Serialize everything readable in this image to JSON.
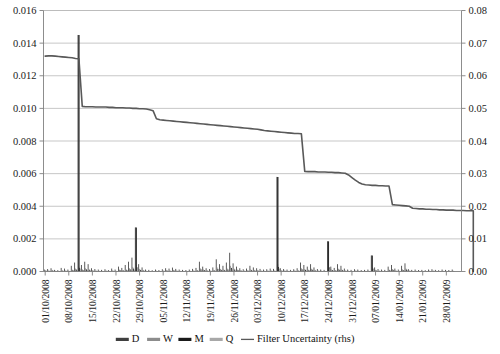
{
  "chart_data": {
    "type": "bar",
    "title": "",
    "subtitle": "",
    "xlabel": "",
    "ylabel": "",
    "y2label": "",
    "grid": true,
    "legend_position": "bottom",
    "ylim": [
      0,
      0.016
    ],
    "y2lim": [
      0,
      0.08
    ],
    "yticks": [
      "0.000",
      "0.002",
      "0.004",
      "0.006",
      "0.008",
      "0.010",
      "0.012",
      "0.014",
      "0.016"
    ],
    "ytick_values": [
      0,
      0.002,
      0.004,
      0.006,
      0.008,
      0.01,
      0.012,
      0.014,
      0.016
    ],
    "y2ticks": [
      "0.00",
      "0.01",
      "0.02",
      "0.03",
      "0.04",
      "0.05",
      "0.06",
      "0.07",
      "0.08"
    ],
    "y2tick_values": [
      0,
      0.01,
      0.02,
      0.03,
      0.04,
      0.05,
      0.06,
      0.07,
      0.08
    ],
    "xticks": [
      "01/10/2008",
      "08/10/2008",
      "15/10/2008",
      "22/10/2008",
      "29/10/2008",
      "05/11/2008",
      "12/11/2008",
      "19/11/2008",
      "26/11/2008",
      "03/12/2008",
      "10/12/2008",
      "17/12/2008",
      "24/12/2008",
      "31/12/2008",
      "07/01/2009",
      "14/01/2009",
      "21/01/2009",
      "28/01/2009"
    ],
    "xtick_indices": [
      0,
      7,
      14,
      21,
      28,
      35,
      42,
      49,
      56,
      63,
      70,
      77,
      84,
      91,
      98,
      105,
      112,
      119
    ],
    "n_points": 124,
    "legend": [
      {
        "label": "D",
        "color": "#3f3f3f",
        "type": "bar"
      },
      {
        "label": "W",
        "color": "#8c8c8c",
        "type": "bar"
      },
      {
        "label": "M",
        "color": "#1a1a1a",
        "type": "bar"
      },
      {
        "label": "Q",
        "color": "#a8a8a8",
        "type": "bar"
      },
      {
        "label": "Filter Uncertainty (rhs)",
        "color": "#595959",
        "type": "line"
      }
    ],
    "series": [
      {
        "name": "D",
        "axis": "left",
        "type": "bar",
        "color": "#3f3f3f",
        "values": [
          0.00012,
          0.00015,
          0.0002,
          0.0001,
          8e-05,
          0.00022,
          0.00018,
          0.00012,
          0.00035,
          0.00055,
          0.0145,
          0.0004,
          0.0006,
          0.00045,
          0.0002,
          0.00015,
          0.00012,
          0.0001,
          0.00014,
          9e-05,
          0.00018,
          0.00012,
          0.0003,
          0.00022,
          0.0004,
          0.0006,
          0.00085,
          0.0027,
          0.00045,
          0.00025,
          0.00012,
          0.0001,
          8e-05,
          0.00012,
          9e-05,
          0.00014,
          0.0002,
          0.00018,
          0.00024,
          0.00016,
          0.00012,
          0.0001,
          9e-05,
          0.00012,
          0.00016,
          0.00022,
          0.0006,
          0.0003,
          0.0002,
          0.00015,
          0.00025,
          0.00075,
          0.00045,
          0.00035,
          0.00055,
          0.00115,
          0.0005,
          0.0003,
          0.0002,
          0.00014,
          0.00018,
          0.00035,
          0.00025,
          0.0002,
          0.00016,
          0.00012,
          0.00014,
          0.00018,
          0.00016,
          0.0058,
          0.0002,
          0.00015,
          0.00012,
          0.0001,
          0.00014,
          0.0002,
          0.00055,
          0.0004,
          0.0003,
          0.00045,
          0.00025,
          0.00015,
          0.00012,
          0.0001,
          0.00185,
          0.0003,
          0.00022,
          0.00045,
          0.00035,
          0.00018,
          0.00012,
          0.0001,
          0.00014,
          0.00012,
          9e-05,
          0.0001,
          0.00012,
          0.00098,
          0.00025,
          0.00015,
          0.00012,
          0.0001,
          0.0003,
          0.0004,
          0.00018,
          0.00012,
          0.00035,
          0.0005,
          0.00014,
          0.0001,
          0.00012,
          9e-05,
          0.0001,
          8e-05,
          0.00012,
          0.00014,
          0.0001,
          8e-05,
          0.00012,
          0.0001,
          9e-05,
          0.00012
        ]
      },
      {
        "name": "W",
        "axis": "left",
        "type": "bar",
        "color": "#8c8c8c",
        "values": [
          8e-05,
          6e-05,
          0.0001,
          5e-05,
          4e-05,
          8e-05,
          6e-05,
          5e-05,
          0.00012,
          0.00018,
          0.0003,
          0.00014,
          0.0002,
          0.00016,
          8e-05,
          6e-05,
          5e-05,
          4e-05,
          6e-05,
          4e-05,
          7e-05,
          5e-05,
          0.00012,
          9e-05,
          0.00014,
          0.0002,
          0.00028,
          0.0004,
          0.00016,
          0.0001,
          5e-05,
          4e-05,
          3e-05,
          5e-05,
          4e-05,
          6e-05,
          8e-05,
          7e-05,
          0.0001,
          6e-05,
          5e-05,
          4e-05,
          4e-05,
          5e-05,
          6e-05,
          9e-05,
          0.0002,
          0.00012,
          8e-05,
          6e-05,
          0.0001,
          0.00025,
          0.00016,
          0.00013,
          0.00018,
          0.00035,
          0.00018,
          0.00012,
          8e-05,
          6e-05,
          7e-05,
          0.00013,
          0.0001,
          8e-05,
          6e-05,
          5e-05,
          6e-05,
          7e-05,
          6e-05,
          0.00045,
          8e-05,
          6e-05,
          5e-05,
          4e-05,
          6e-05,
          8e-05,
          0.0002,
          0.00015,
          0.00012,
          0.00017,
          0.0001,
          6e-05,
          5e-05,
          4e-05,
          0.0004,
          0.00012,
          9e-05,
          0.00017,
          0.00013,
          7e-05,
          5e-05,
          4e-05,
          6e-05,
          5e-05,
          4e-05,
          4e-05,
          5e-05,
          0.00028,
          0.0001,
          6e-05,
          5e-05,
          4e-05,
          0.00012,
          0.00015,
          7e-05,
          5e-05,
          0.00013,
          0.00019,
          6e-05,
          4e-05,
          5e-05,
          4e-05,
          4e-05,
          3e-05,
          5e-05,
          6e-05,
          4e-05,
          3e-05,
          5e-05,
          4e-05,
          4e-05,
          5e-05
        ]
      },
      {
        "name": "M",
        "axis": "left",
        "type": "bar",
        "color": "#1a1a1a",
        "values": [
          5e-05,
          4e-05,
          6e-05,
          3e-05,
          3e-05,
          5e-05,
          4e-05,
          3e-05,
          8e-05,
          0.00012,
          0.00022,
          9e-05,
          0.00013,
          0.0001,
          5e-05,
          4e-05,
          3e-05,
          3e-05,
          4e-05,
          3e-05,
          4e-05,
          3e-05,
          8e-05,
          6e-05,
          9e-05,
          0.00013,
          0.00018,
          0.00026,
          0.0001,
          6e-05,
          3e-05,
          3e-05,
          2e-05,
          3e-05,
          3e-05,
          4e-05,
          5e-05,
          4e-05,
          6e-05,
          4e-05,
          3e-05,
          3e-05,
          2e-05,
          3e-05,
          4e-05,
          6e-05,
          0.00013,
          8e-05,
          5e-05,
          4e-05,
          6e-05,
          0.00016,
          0.0001,
          8e-05,
          0.00012,
          0.00022,
          0.00012,
          8e-05,
          5e-05,
          4e-05,
          5e-05,
          8e-05,
          6e-05,
          5e-05,
          4e-05,
          3e-05,
          4e-05,
          4e-05,
          4e-05,
          0.00028,
          5e-05,
          4e-05,
          3e-05,
          3e-05,
          4e-05,
          5e-05,
          0.00013,
          0.0001,
          8e-05,
          0.00011,
          6e-05,
          4e-05,
          3e-05,
          3e-05,
          0.00026,
          8e-05,
          6e-05,
          0.00011,
          8e-05,
          4e-05,
          3e-05,
          3e-05,
          4e-05,
          3e-05,
          2e-05,
          3e-05,
          3e-05,
          0.00018,
          6e-05,
          4e-05,
          3e-05,
          3e-05,
          8e-05,
          0.0001,
          4e-05,
          3e-05,
          8e-05,
          0.00012,
          4e-05,
          3e-05,
          3e-05,
          2e-05,
          3e-05,
          2e-05,
          3e-05,
          4e-05,
          3e-05,
          2e-05,
          3e-05,
          3e-05,
          2e-05,
          3e-05
        ]
      },
      {
        "name": "Q",
        "axis": "left",
        "type": "bar",
        "color": "#a8a8a8",
        "values": [
          3e-05,
          2e-05,
          4e-05,
          2e-05,
          2e-05,
          3e-05,
          2e-05,
          2e-05,
          5e-05,
          7e-05,
          0.00014,
          5e-05,
          8e-05,
          6e-05,
          3e-05,
          2e-05,
          2e-05,
          2e-05,
          2e-05,
          2e-05,
          3e-05,
          2e-05,
          5e-05,
          4e-05,
          6e-05,
          8e-05,
          0.00011,
          0.00016,
          6e-05,
          4e-05,
          2e-05,
          2e-05,
          1e-05,
          2e-05,
          2e-05,
          2e-05,
          3e-05,
          3e-05,
          4e-05,
          2e-05,
          2e-05,
          2e-05,
          1e-05,
          2e-05,
          2e-05,
          4e-05,
          8e-05,
          5e-05,
          3e-05,
          2e-05,
          4e-05,
          0.0001,
          6e-05,
          5e-05,
          7e-05,
          0.00013,
          7e-05,
          5e-05,
          3e-05,
          2e-05,
          3e-05,
          5e-05,
          4e-05,
          3e-05,
          2e-05,
          2e-05,
          2e-05,
          3e-05,
          2e-05,
          0.00017,
          3e-05,
          2e-05,
          2e-05,
          2e-05,
          2e-05,
          3e-05,
          8e-05,
          6e-05,
          5e-05,
          7e-05,
          4e-05,
          2e-05,
          2e-05,
          2e-05,
          0.00016,
          5e-05,
          4e-05,
          7e-05,
          5e-05,
          3e-05,
          2e-05,
          2e-05,
          2e-05,
          2e-05,
          1e-05,
          2e-05,
          2e-05,
          0.00011,
          4e-05,
          2e-05,
          2e-05,
          2e-05,
          5e-05,
          6e-05,
          3e-05,
          2e-05,
          5e-05,
          8e-05,
          2e-05,
          2e-05,
          2e-05,
          1e-05,
          2e-05,
          1e-05,
          2e-05,
          2e-05,
          2e-05,
          1e-05,
          2e-05,
          2e-05,
          1e-05,
          2e-05
        ]
      },
      {
        "name": "Filter Uncertainty (rhs)",
        "axis": "right",
        "type": "line",
        "color": "#595959",
        "values": [
          0.066,
          0.0661,
          0.0661,
          0.066,
          0.0659,
          0.0658,
          0.0657,
          0.0656,
          0.0655,
          0.0653,
          0.0652,
          0.0506,
          0.0505,
          0.0505,
          0.0505,
          0.0504,
          0.0504,
          0.0504,
          0.0504,
          0.0503,
          0.0503,
          0.0502,
          0.0502,
          0.0502,
          0.0501,
          0.0501,
          0.05,
          0.05,
          0.0499,
          0.0499,
          0.0498,
          0.0496,
          0.0493,
          0.0468,
          0.0465,
          0.0464,
          0.0463,
          0.0462,
          0.0461,
          0.046,
          0.0459,
          0.0458,
          0.0457,
          0.0456,
          0.0455,
          0.0454,
          0.0453,
          0.0452,
          0.0451,
          0.045,
          0.0449,
          0.0448,
          0.0447,
          0.0446,
          0.0445,
          0.0444,
          0.0443,
          0.0442,
          0.0441,
          0.044,
          0.0439,
          0.0438,
          0.0437,
          0.0436,
          0.0434,
          0.0432,
          0.0431,
          0.043,
          0.0429,
          0.0428,
          0.0427,
          0.0426,
          0.0425,
          0.0424,
          0.0423,
          0.0423,
          0.0422,
          0.0307,
          0.0306,
          0.0306,
          0.0306,
          0.0305,
          0.0305,
          0.0305,
          0.0304,
          0.0304,
          0.0303,
          0.0303,
          0.0302,
          0.0301,
          0.0296,
          0.0288,
          0.028,
          0.0273,
          0.0268,
          0.0266,
          0.0265,
          0.0264,
          0.0264,
          0.0263,
          0.0263,
          0.0262,
          0.0262,
          0.0205,
          0.0204,
          0.0203,
          0.0202,
          0.0201,
          0.02,
          0.0194,
          0.0193,
          0.0192,
          0.0192,
          0.0191,
          0.0191,
          0.019,
          0.019,
          0.0189,
          0.0189,
          0.0188,
          0.0188,
          0.0188,
          0.0187,
          0.0187,
          0.0187,
          0.0186,
          0.0186,
          0.0186
        ]
      }
    ],
    "spikes": [
      {
        "label": "vertical-spike-1",
        "index": 10,
        "value": 0.0145
      },
      {
        "label": "vertical-spike-2",
        "index": 27,
        "value": 0.0027
      },
      {
        "label": "vertical-spike-3",
        "index": 69,
        "value": 0.0058
      },
      {
        "label": "vertical-spike-4",
        "index": 84,
        "value": 0.00185
      },
      {
        "label": "vertical-spike-5",
        "index": 97,
        "value": 0.00098
      }
    ]
  },
  "axes": {
    "left_axis_name": "left-value-axis",
    "right_axis_name": "right-value-axis",
    "category_axis_name": "date-category-axis"
  }
}
